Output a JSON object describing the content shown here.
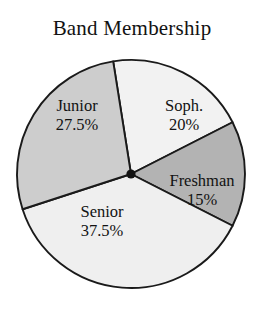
{
  "chart_data": {
    "type": "pie",
    "title": "Band Membership",
    "xlabel": "",
    "ylabel": "",
    "categories": [
      "Soph.",
      "Freshman",
      "Senior",
      "Junior"
    ],
    "values": [
      20,
      15,
      37.5,
      27.5
    ],
    "value_unit": "%",
    "legend": "none",
    "grid": false,
    "start_angle_deg": -9,
    "direction": "clockwise",
    "slices": [
      {
        "label": "Soph.",
        "value": 20,
        "value_text": "20%",
        "color": "#f2f2f2",
        "start_deg": -9,
        "end_deg": 63
      },
      {
        "label": "Freshman",
        "value": 15,
        "value_text": "15%",
        "color": "#b3b3b3",
        "start_deg": 63,
        "end_deg": 117
      },
      {
        "label": "Senior",
        "value": 37.5,
        "value_text": "37.5%",
        "color": "#efefef",
        "start_deg": 117,
        "end_deg": 252
      },
      {
        "label": "Junior",
        "value": 27.5,
        "value_text": "27.5%",
        "color": "#cdcdcd",
        "start_deg": 252,
        "end_deg": 351
      }
    ],
    "geometry": {
      "center_x": 131,
      "center_y": 174,
      "radius": 114
    },
    "style": {
      "outline_color": "#1a1a1a",
      "center_dot_color": "#141414",
      "background": "#ffffff"
    }
  },
  "labels": {
    "junior": {
      "name": "Junior",
      "value": "27.5%"
    },
    "soph": {
      "name": "Soph.",
      "value": "20%"
    },
    "freshman": {
      "name": "Freshman",
      "value": "15%"
    },
    "senior": {
      "name": "Senior",
      "value": "37.5%"
    }
  }
}
